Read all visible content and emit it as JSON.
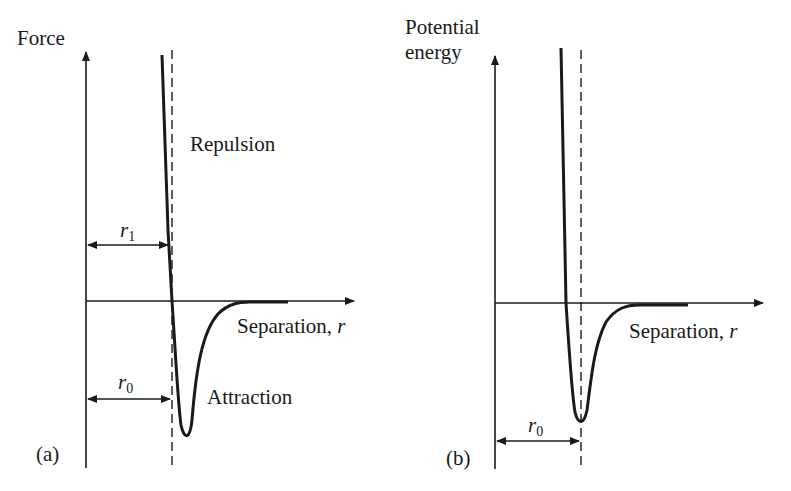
{
  "figure": {
    "panels": [
      {
        "id": "a",
        "panel_label": "(a)",
        "y_axis_label": "Force",
        "x_axis_label": "Separation, ",
        "x_axis_var": "r",
        "region_labels": {
          "upper": "Repulsion",
          "lower": "Attraction"
        },
        "markers": [
          {
            "symbol": "r",
            "subscript": "1",
            "meaning": "separation where force curve crosses zero"
          },
          {
            "symbol": "r",
            "subscript": "0",
            "meaning": "equilibrium separation"
          }
        ]
      },
      {
        "id": "b",
        "panel_label": "(b)",
        "y_axis_label_line1": "Potential",
        "y_axis_label_line2": "energy",
        "x_axis_label": "Separation, ",
        "x_axis_var": "r",
        "markers": [
          {
            "symbol": "r",
            "subscript": "0",
            "meaning": "separation at potential energy minimum"
          }
        ]
      }
    ],
    "colors": {
      "ink": "#1a1a1a",
      "background": "#ffffff"
    }
  }
}
